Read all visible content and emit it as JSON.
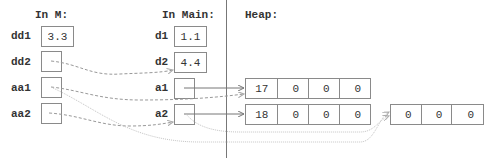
{
  "frames": {
    "m": {
      "title": "In M:",
      "vars": [
        {
          "name": "dd1",
          "value": "3.3"
        },
        {
          "name": "dd2",
          "value": ""
        },
        {
          "name": "aa1",
          "value": ""
        },
        {
          "name": "aa2",
          "value": ""
        }
      ]
    },
    "main": {
      "title": "In Main:",
      "vars": [
        {
          "name": "d1",
          "value": "1.1"
        },
        {
          "name": "d2",
          "value": "4.4"
        },
        {
          "name": "a1",
          "value": ""
        },
        {
          "name": "a2",
          "value": ""
        }
      ]
    }
  },
  "heap": {
    "title": "Heap:",
    "arrays": [
      {
        "cells": [
          "17",
          "0",
          "0",
          "0"
        ]
      },
      {
        "cells": [
          "18",
          "0",
          "0",
          "0"
        ]
      },
      {
        "cells": [
          "0",
          "0",
          "0"
        ]
      }
    ]
  },
  "colors": {
    "solid_arrow": "#666666",
    "dashed_arrow": "#999999",
    "dotted_arrow": "#bbbbbb"
  }
}
